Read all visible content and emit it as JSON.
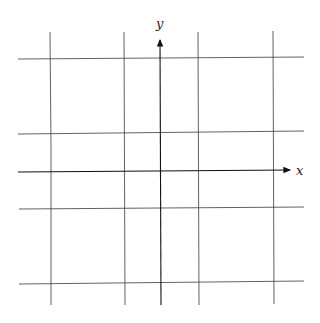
{
  "diagram": {
    "type": "coordinate-grid",
    "axes": {
      "x_label": "x",
      "y_label": "y"
    },
    "vertical_lines_x": [
      50,
      124,
      198,
      273
    ],
    "horizontal_lines_y": [
      58,
      133,
      208,
      283
    ],
    "y_axis_x": 160,
    "x_axis_y": 171,
    "colors": {
      "line": "#3a3a3a",
      "axis": "#111111",
      "background": "#ffffff"
    }
  }
}
